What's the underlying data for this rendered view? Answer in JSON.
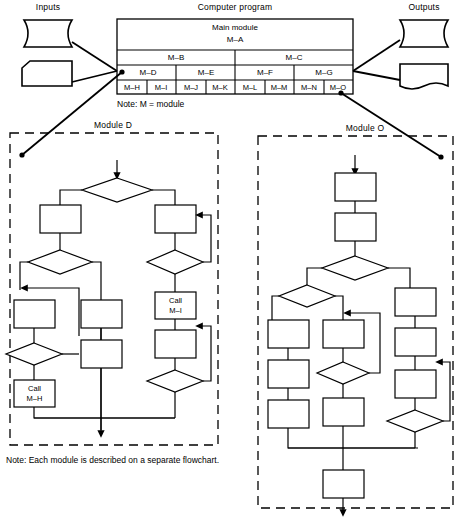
{
  "diagram": {
    "inputs_label": "Inputs",
    "outputs_label": "Outputs",
    "program_label": "Computer program",
    "main_module_line1": "Main module",
    "main_module_line2": "M–A",
    "note_module": "Note:  M = module",
    "note_flowchart": "Note:  Each module is described on a separate flowchart.",
    "module_d_title": "Module D",
    "module_o_title": "Module O",
    "call_mh_line1": "Call",
    "call_mh_line2": "M–H",
    "call_mi_line1": "Call",
    "call_mi_line2": "M–I",
    "hierarchy": {
      "level2": [
        "M–B",
        "M–C"
      ],
      "level3": [
        "M–D",
        "M–E",
        "M–F",
        "M–G"
      ],
      "level4": [
        "M–H",
        "M–I",
        "M–J",
        "M–K",
        "M–L",
        "M–M",
        "M–N",
        "M–O"
      ]
    },
    "colors": {
      "line": "#000000",
      "background": "#ffffff"
    }
  }
}
